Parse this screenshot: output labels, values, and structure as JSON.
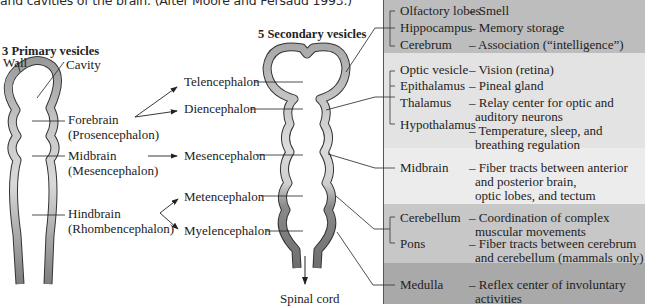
{
  "caption": {
    "line1": "and cavities of the brain. (After Moore and Persaud 1993.)"
  },
  "primary": {
    "heading": "3 Primary vesicles",
    "wall_label": "Wall",
    "cavity_label": "Cavity",
    "regions": [
      {
        "name": "Forebrain",
        "latin": "(Prosencephalon)"
      },
      {
        "name": "Midbrain",
        "latin": "(Mesencephalon)"
      },
      {
        "name": "Hindbrain",
        "latin": "(Rhombencephalon)"
      }
    ]
  },
  "secondary": {
    "heading": "5 Secondary vesicles",
    "vesicles": [
      "Telencephalon",
      "Diencephalon",
      "Mesencephalon",
      "Metencephalon",
      "Myelencephalon"
    ],
    "spinal_cord_label": "Spinal cord"
  },
  "table": {
    "colors": {
      "band1": "#bdbdbd",
      "band2": "#e2e2e2",
      "band3": "#ececec",
      "band4": "#c6c6c6",
      "band5": "#a9a9a9",
      "divider": "#555555"
    },
    "groups": [
      {
        "band": "telencephalon",
        "rows": [
          {
            "structure": "Olfactory lobes",
            "function": "– Smell"
          },
          {
            "structure": "Hippocampus",
            "function": "– Memory storage"
          },
          {
            "structure": "Cerebrum",
            "function": "– Association (“intelligence”)"
          }
        ]
      },
      {
        "band": "diencephalon",
        "rows": [
          {
            "structure": "Optic vesicle",
            "function": "– Vision (retina)"
          },
          {
            "structure": "Epithalamus",
            "function": "– Pineal gland"
          },
          {
            "structure": "Thalamus",
            "function": "– Relay center for optic and",
            "function2": "auditory neurons"
          },
          {
            "structure": "Hypothalamus",
            "function": "– Temperature, sleep, and",
            "function2": "breathing regulation"
          }
        ]
      },
      {
        "band": "mesencephalon",
        "rows": [
          {
            "structure": "Midbrain",
            "function": "– Fiber tracts between anterior",
            "function2": "and posterior brain,",
            "function3": "optic lobes, and tectum"
          }
        ]
      },
      {
        "band": "metencephalon",
        "rows": [
          {
            "structure": "Cerebellum",
            "function": "– Coordination of complex",
            "function2": "muscular movements"
          },
          {
            "structure": "Pons",
            "function": "– Fiber tracts between cerebrum",
            "function2": "and cerebellum (mammals only)"
          }
        ]
      },
      {
        "band": "myelencephalon",
        "rows": [
          {
            "structure": "Medulla",
            "function": "– Reflex center of involuntary",
            "function2": "activities"
          }
        ]
      }
    ]
  }
}
